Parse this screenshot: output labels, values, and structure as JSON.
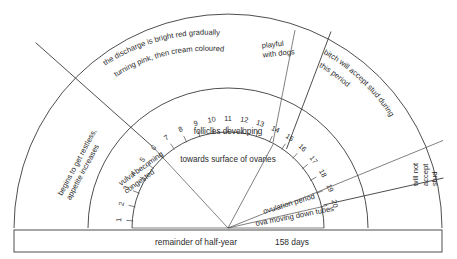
{
  "diagram": {
    "type": "semicircular-dial",
    "center": {
      "x": 228,
      "y": 228
    },
    "outer_radius": 214,
    "mid_radius": 140,
    "inner_radius": 96,
    "scale": {
      "name": "day-scale",
      "min": 1,
      "max": 20,
      "start_angle_deg": 180,
      "end_angle_deg": 0,
      "ticks": [
        1,
        2,
        3,
        4,
        5,
        6,
        7,
        8,
        9,
        10,
        11,
        12,
        13,
        14,
        15,
        16,
        17,
        18,
        19,
        20
      ],
      "labels": [
        "1",
        "2",
        "3",
        "4",
        "5",
        "6",
        "7",
        "8",
        "9",
        "10",
        "11",
        "12",
        "13",
        "14",
        "15",
        "16",
        "17",
        "18",
        "19",
        "20"
      ]
    },
    "outer_sectors": [
      {
        "id": "restless",
        "label": "begins to get restless,\nappetite increases",
        "lines": [
          "begins to get restless,",
          "appetite increases"
        ]
      },
      {
        "id": "discharge",
        "label": "the discharge is bright red gradually\nturning pink, then cream coloured",
        "lines": [
          "the discharge is bright red gradually",
          "turning pink, then cream coloured"
        ]
      },
      {
        "id": "playful",
        "label": "playful\nwith dogs",
        "lines": [
          "playful",
          "with dogs"
        ]
      },
      {
        "id": "accept",
        "label": "bitch will accept stud during\nthis period",
        "lines": [
          "bitch will accept stud during",
          "this period"
        ]
      },
      {
        "id": "not-accept",
        "label": "will not\naccept\nstud",
        "lines": [
          "will not",
          "accept",
          "stud"
        ]
      }
    ],
    "inner_sectors": [
      {
        "id": "vulva",
        "label": "vulva becoming\ncongested",
        "lines": [
          "vulva becoming",
          "congested"
        ]
      },
      {
        "id": "follicles",
        "label": "follicles developing",
        "lines": [
          "follicles developing"
        ]
      },
      {
        "id": "ovaries",
        "label": "towards surface of ovaries",
        "lines": [
          "towards surface of ovaries"
        ]
      },
      {
        "id": "ovulation",
        "label": "ovulation period",
        "lines": [
          "ovulation period"
        ]
      },
      {
        "id": "ova",
        "label": "ova moving down tubes",
        "lines": [
          "ova moving down tubes"
        ]
      }
    ],
    "footer": {
      "remainder_label": "remainder of half-year",
      "days_value": "158 days"
    },
    "colors": {
      "stroke": "#3a3a3a",
      "text": "#2b2b2b",
      "background": "#ffffff"
    }
  }
}
